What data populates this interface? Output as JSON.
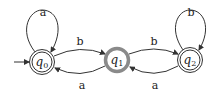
{
  "diagram": {
    "type": "finite-automaton",
    "start_state": "q0",
    "states": [
      {
        "id": "q0",
        "name": "q",
        "sub": "0",
        "accepting": true,
        "highlighted": false,
        "cx": 42,
        "cy": 62
      },
      {
        "id": "q1",
        "name": "q",
        "sub": "1",
        "accepting": false,
        "highlighted": true,
        "cx": 117,
        "cy": 60
      },
      {
        "id": "q2",
        "name": "q",
        "sub": "2",
        "accepting": true,
        "highlighted": false,
        "cx": 190,
        "cy": 60
      }
    ],
    "transitions": [
      {
        "from": "q0",
        "to": "q0",
        "label": "a"
      },
      {
        "from": "q0",
        "to": "q1",
        "label": "b"
      },
      {
        "from": "q1",
        "to": "q0",
        "label": "a"
      },
      {
        "from": "q1",
        "to": "q2",
        "label": "b"
      },
      {
        "from": "q2",
        "to": "q1",
        "label": "a"
      },
      {
        "from": "q2",
        "to": "q2",
        "label": "b"
      }
    ],
    "colors": {
      "stroke": "#333333",
      "highlight": "#8a8a8a"
    }
  }
}
